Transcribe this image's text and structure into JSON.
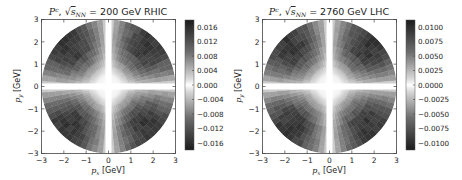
{
  "chart_data": [
    {
      "type": "heatmap",
      "title": "P^c, √s_NN = 200 GeV RHIC",
      "title_parts": {
        "symbol": "P",
        "sup": "c",
        "sqrt_arg": "s",
        "sub": "NN",
        "rest": " = 200 GeV RHIC"
      },
      "xlabel": "p_x [GeV]",
      "ylabel": "p_y [GeV]",
      "xlabel_parts": {
        "var": "p",
        "sub": "x",
        "unit": "[GeV]"
      },
      "ylabel_parts": {
        "var": "p",
        "sub": "y",
        "unit": "[GeV]"
      },
      "xlim": [
        -3,
        3
      ],
      "ylim": [
        -3,
        3
      ],
      "xticks": [
        "−3",
        "−2",
        "−1",
        "0",
        "1",
        "2",
        "3"
      ],
      "yticks": [
        "3",
        "2",
        "1",
        "0",
        "−1",
        "−2",
        "−3"
      ],
      "colorbar": {
        "range": [
          -0.018,
          0.018
        ],
        "ticks": [
          "0.016",
          "0.012",
          "0.008",
          "0.004",
          "0.000",
          "−0.004",
          "−0.008",
          "−0.012",
          "−0.016"
        ]
      },
      "description": "Disk of radius 3 GeV; near-zero (white) along px and py axes and at origin; magnitude grows toward diagonals and with radius."
    },
    {
      "type": "heatmap",
      "title": "P^c, √s_NN = 2760 GeV LHC",
      "title_parts": {
        "symbol": "P",
        "sup": "c",
        "sqrt_arg": "s",
        "sub": "NN",
        "rest": " = 2760 GeV LHC"
      },
      "xlabel": "p_x [GeV]",
      "ylabel": "p_y [GeV]",
      "xlabel_parts": {
        "var": "p",
        "sub": "x",
        "unit": "[GeV]"
      },
      "ylabel_parts": {
        "var": "p",
        "sub": "y",
        "unit": "[GeV]"
      },
      "xlim": [
        -3,
        3
      ],
      "ylim": [
        -3,
        3
      ],
      "xticks": [
        "−3",
        "−2",
        "−1",
        "0",
        "1",
        "2",
        "3"
      ],
      "yticks": [
        "3",
        "2",
        "1",
        "0",
        "−1",
        "−2",
        "−3"
      ],
      "colorbar": {
        "range": [
          -0.0112,
          0.0112
        ],
        "ticks": [
          "0.0100",
          "0.0075",
          "0.0050",
          "0.0025",
          "0.0000",
          "−0.0025",
          "−0.0050",
          "−0.0075",
          "−0.0100"
        ]
      },
      "description": "Disk of radius 3 GeV; near-zero (white) along px and py axes and at origin; magnitude grows toward diagonals and with radius."
    }
  ],
  "panels": [
    {
      "title_symbol": "P",
      "title_sup": "c",
      "title_sqrt": "s",
      "title_sub": "NN",
      "title_rest": " = 200 GeV RHIC",
      "xlabel_var": "p",
      "xlabel_sub": "x",
      "xlabel_unit": "[GeV]",
      "ylabel_var": "p",
      "ylabel_sub": "y",
      "ylabel_unit": "[GeV]",
      "xticks": [
        "−3",
        "−2",
        "−1",
        "0",
        "1",
        "2",
        "3"
      ],
      "yticks": [
        "3",
        "2",
        "1",
        "0",
        "−1",
        "−2",
        "−3"
      ],
      "cbar_ticks": [
        "0.016",
        "0.012",
        "0.008",
        "0.004",
        "0.000",
        "−0.004",
        "−0.008",
        "−0.012",
        "−0.016"
      ]
    },
    {
      "title_symbol": "P",
      "title_sup": "c",
      "title_sqrt": "s",
      "title_sub": "NN",
      "title_rest": " = 2760 GeV LHC",
      "xlabel_var": "p",
      "xlabel_sub": "x",
      "xlabel_unit": "[GeV]",
      "ylabel_var": "p",
      "ylabel_sub": "y",
      "ylabel_unit": "[GeV]",
      "xticks": [
        "−3",
        "−2",
        "−1",
        "0",
        "1",
        "2",
        "3"
      ],
      "yticks": [
        "3",
        "2",
        "1",
        "0",
        "−1",
        "−2",
        "−3"
      ],
      "cbar_ticks": [
        "0.0100",
        "0.0075",
        "0.0050",
        "0.0025",
        "0.0000",
        "−0.0025",
        "−0.0050",
        "−0.0075",
        "−0.0100"
      ]
    }
  ]
}
